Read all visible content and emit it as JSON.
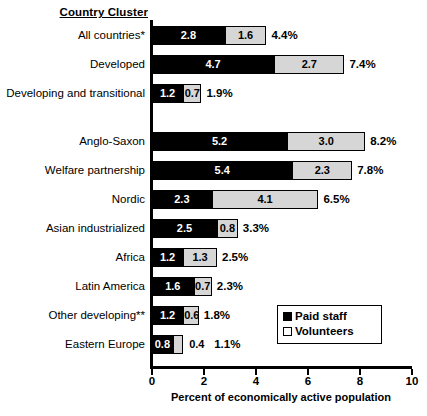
{
  "chart_data": {
    "type": "bar",
    "orientation": "horizontal",
    "stacked": true,
    "title": "",
    "header_label": "Country Cluster",
    "xlabel": "Percent of economically active population",
    "ylabel": "",
    "xlim": [
      0,
      10
    ],
    "xticks": [
      0,
      2,
      4,
      6,
      8,
      10
    ],
    "xtick_labels": [
      "0",
      "2",
      "4",
      "6",
      "8",
      "10"
    ],
    "grid": false,
    "legend_position": "lower-right",
    "series": [
      {
        "name": "Paid staff",
        "color": "#000000",
        "values": [
          2.8,
          4.7,
          1.2,
          5.2,
          5.4,
          2.3,
          2.5,
          1.2,
          1.6,
          1.2,
          0.8
        ]
      },
      {
        "name": "Volunteers",
        "color": "#d6d6d6",
        "values": [
          1.6,
          2.7,
          0.7,
          3.0,
          2.3,
          4.1,
          0.8,
          1.3,
          0.7,
          0.6,
          0.4
        ]
      }
    ],
    "categories": [
      "All countries*",
      "Developed",
      "Developing and transitional",
      "Anglo-Saxon",
      "Welfare partnership",
      "Nordic",
      "Asian industrialized",
      "Africa",
      "Latin America",
      "Other developing**",
      "Eastern Europe"
    ],
    "totals": [
      4.4,
      7.4,
      1.9,
      8.2,
      7.8,
      6.5,
      3.3,
      2.5,
      2.3,
      1.8,
      1.1
    ],
    "total_labels": [
      "4.4%",
      "7.4%",
      "1.9%",
      "8.2%",
      "7.8%",
      "6.5%",
      "3.3%",
      "2.5%",
      "2.3%",
      "1.8%",
      "1.1%"
    ]
  },
  "rows": [
    {
      "label": "All countries*",
      "paid": 2.8,
      "vol": 1.6,
      "paid_label": "2.8",
      "vol_label": "1.6",
      "total_label": "4.4%",
      "vol_label_outside": false,
      "group": 1
    },
    {
      "label": "Developed",
      "paid": 4.7,
      "vol": 2.7,
      "paid_label": "4.7",
      "vol_label": "2.7",
      "total_label": "7.4%",
      "vol_label_outside": false,
      "group": 1
    },
    {
      "label": "Developing and transitional",
      "paid": 1.2,
      "vol": 0.7,
      "paid_label": "1.2",
      "vol_label": "0.7",
      "total_label": "1.9%",
      "vol_label_outside": false,
      "group": 1
    },
    {
      "label": "Anglo-Saxon",
      "paid": 5.2,
      "vol": 3.0,
      "paid_label": "5.2",
      "vol_label": "3.0",
      "total_label": "8.2%",
      "vol_label_outside": false,
      "group": 2
    },
    {
      "label": "Welfare partnership",
      "paid": 5.4,
      "vol": 2.3,
      "paid_label": "5.4",
      "vol_label": "2.3",
      "total_label": "7.8%",
      "vol_label_outside": false,
      "group": 2
    },
    {
      "label": "Nordic",
      "paid": 2.3,
      "vol": 4.1,
      "paid_label": "2.3",
      "vol_label": "4.1",
      "total_label": "6.5%",
      "vol_label_outside": false,
      "group": 2
    },
    {
      "label": "Asian industrialized",
      "paid": 2.5,
      "vol": 0.8,
      "paid_label": "2.5",
      "vol_label": "0.8",
      "total_label": "3.3%",
      "vol_label_outside": false,
      "group": 2
    },
    {
      "label": "Africa",
      "paid": 1.2,
      "vol": 1.3,
      "paid_label": "1.2",
      "vol_label": "1.3",
      "total_label": "2.5%",
      "vol_label_outside": false,
      "group": 2
    },
    {
      "label": "Latin America",
      "paid": 1.6,
      "vol": 0.7,
      "paid_label": "1.6",
      "vol_label": "0.7",
      "total_label": "2.3%",
      "vol_label_outside": false,
      "group": 2
    },
    {
      "label": "Other developing**",
      "paid": 1.2,
      "vol": 0.6,
      "paid_label": "1.2",
      "vol_label": "0.6",
      "total_label": "1.8%",
      "vol_label_outside": false,
      "group": 2
    },
    {
      "label": "Eastern Europe",
      "paid": 0.8,
      "vol": 0.4,
      "paid_label": "0.8",
      "vol_label": "0.4",
      "total_label": "1.1%",
      "vol_label_outside": true,
      "group": 2
    }
  ],
  "axis": {
    "ticks": [
      "0",
      "2",
      "4",
      "6",
      "8",
      "10"
    ],
    "tick_values": [
      0,
      2,
      4,
      6,
      8,
      10
    ],
    "title": "Percent of economically active population"
  },
  "header": {
    "cluster_label": "Country Cluster"
  },
  "legend": {
    "items": [
      {
        "label": "Paid staff",
        "swatch": "filled"
      },
      {
        "label": "Volunteers",
        "swatch": "open"
      }
    ]
  }
}
